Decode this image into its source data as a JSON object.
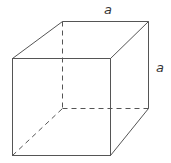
{
  "diagram": {
    "type": "cube",
    "labels": {
      "top_edge": "a",
      "right_edge": "a"
    },
    "line_color": "#555555",
    "hidden_edge_style": "dashed"
  }
}
